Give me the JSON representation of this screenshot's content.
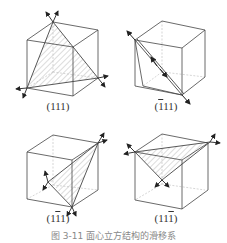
{
  "figure": {
    "panels": [
      {
        "id": "p111",
        "label_parts": [
          "(",
          "1",
          "1",
          "1",
          ")"
        ],
        "overbar": [
          false,
          false,
          false
        ],
        "label": "(111)"
      },
      {
        "id": "pm111",
        "label_parts": [
          "(",
          "1",
          "1",
          "1",
          ")"
        ],
        "overbar": [
          true,
          false,
          false
        ],
        "label": "(1̄11)"
      },
      {
        "id": "p1m11",
        "label_parts": [
          "(",
          "1",
          "1",
          "1",
          ")"
        ],
        "overbar": [
          false,
          true,
          false
        ],
        "label": "(11̄1)"
      },
      {
        "id": "p11m1",
        "label_parts": [
          "(",
          "1",
          "1",
          "1",
          ")"
        ],
        "overbar": [
          false,
          false,
          true
        ],
        "label": "(111̄)"
      }
    ],
    "caption": "图 3-11 面心立方结构的滑移系"
  },
  "colors": {
    "line": "#444444",
    "hidden": "#bbbbbb",
    "hatch": "#999999",
    "arrow": "#222222"
  }
}
